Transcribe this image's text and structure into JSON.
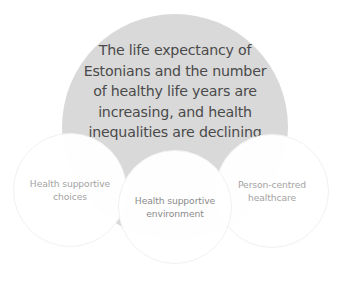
{
  "diagram": {
    "type": "venn-like",
    "central_goal": {
      "lines": [
        "The life expectancy of",
        "Estonians and the number",
        "of healthy life years are",
        "increasing, and health",
        "inequalities are declining"
      ],
      "fill_color": "#d9d9d9",
      "text_color": "#4a4a4a"
    },
    "pillars": [
      {
        "id": "choices",
        "lines": [
          "Health supportive",
          "choices"
        ]
      },
      {
        "id": "environment",
        "lines": [
          "Health supportive",
          "environment"
        ]
      },
      {
        "id": "healthcare",
        "lines": [
          "Person-centred",
          "healthcare"
        ]
      }
    ],
    "pillar_fill_color": "#ffffff",
    "pillar_text_color": "#a3a3a3"
  }
}
